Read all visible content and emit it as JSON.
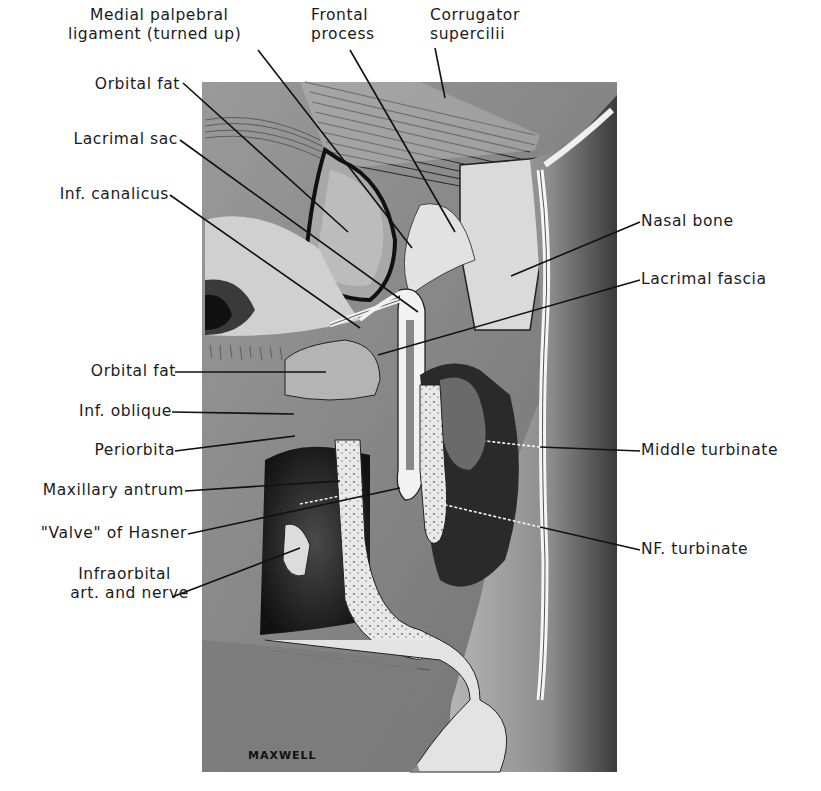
{
  "figure": {
    "signature": "MAXWELL",
    "colors": {
      "background": "#ffffff",
      "ink": "#1a1a1a",
      "illustration_mid": "#8a8a8a",
      "illustration_dark": "#2a2a2a",
      "bone": "#e6e6e6"
    }
  },
  "labels_top": [
    {
      "id": "medial-palpebral-ligament",
      "line1": "Medial palpebral",
      "line2": "ligament (turned up)"
    },
    {
      "id": "frontal-process",
      "line1": "Frontal",
      "line2": "process"
    },
    {
      "id": "corrugator-supercilii",
      "line1": "Corrugator",
      "line2": "supercilii"
    }
  ],
  "labels_left": [
    {
      "id": "orbital-fat-upper",
      "text": "Orbital fat"
    },
    {
      "id": "lacrimal-sac",
      "text": "Lacrimal sac"
    },
    {
      "id": "inf-canalicus",
      "text": "Inf. canalicus"
    },
    {
      "id": "orbital-fat-lower",
      "text": "Orbital fat"
    },
    {
      "id": "inf-oblique",
      "text": "Inf. oblique"
    },
    {
      "id": "periorbita",
      "text": "Periorbita"
    },
    {
      "id": "maxillary-antrum",
      "text": "Maxillary antrum"
    },
    {
      "id": "valve-of-hasner",
      "text": "\"Valve\" of Hasner"
    },
    {
      "id": "infraorbital-art-nerve",
      "line1": "Infraorbital",
      "line2": "art. and nerve"
    }
  ],
  "labels_right": [
    {
      "id": "nasal-bone",
      "text": "Nasal bone"
    },
    {
      "id": "lacrimal-fascia",
      "text": "Lacrimal fascia"
    },
    {
      "id": "middle-turbinate",
      "text": "Middle turbinate"
    },
    {
      "id": "nf-turbinate",
      "text": "NF. turbinate"
    }
  ]
}
